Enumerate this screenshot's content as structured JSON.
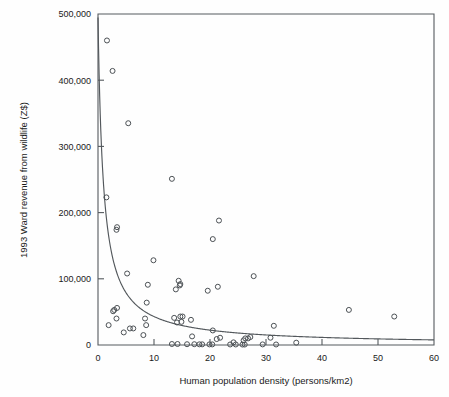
{
  "chart_data": {
    "type": "scatter",
    "title": "",
    "xlabel": "Human population density (persons/km2)",
    "ylabel": "1993 Ward revenue from wildlife (Z$)",
    "xlim": [
      0,
      60
    ],
    "ylim": [
      0,
      500000
    ],
    "xticks": [
      0,
      10,
      20,
      30,
      40,
      50,
      60
    ],
    "yticks": [
      0,
      100000,
      200000,
      300000,
      400000,
      500000
    ],
    "xtick_labels": [
      "0",
      "10",
      "20",
      "30",
      "40",
      "50",
      "60"
    ],
    "ytick_labels": [
      "0",
      "100,000",
      "200,000",
      "300,000",
      "400,000",
      "500,000"
    ],
    "grid": false,
    "legend": null,
    "marker": "open-circle",
    "marker_color": "#4c5155",
    "points": [
      {
        "x": 1.6,
        "y": 460000
      },
      {
        "x": 2.6,
        "y": 414000
      },
      {
        "x": 5.4,
        "y": 335000
      },
      {
        "x": 13.2,
        "y": 251000
      },
      {
        "x": 1.5,
        "y": 223000
      },
      {
        "x": 21.6,
        "y": 188000
      },
      {
        "x": 3.4,
        "y": 178000
      },
      {
        "x": 3.3,
        "y": 174000
      },
      {
        "x": 20.5,
        "y": 160000
      },
      {
        "x": 9.9,
        "y": 128000
      },
      {
        "x": 5.2,
        "y": 108000
      },
      {
        "x": 27.8,
        "y": 104000
      },
      {
        "x": 14.4,
        "y": 97000
      },
      {
        "x": 14.7,
        "y": 92000
      },
      {
        "x": 8.9,
        "y": 91000
      },
      {
        "x": 14.6,
        "y": 90000
      },
      {
        "x": 21.4,
        "y": 88000
      },
      {
        "x": 13.9,
        "y": 84000
      },
      {
        "x": 19.6,
        "y": 82000
      },
      {
        "x": 8.7,
        "y": 64000
      },
      {
        "x": 3.4,
        "y": 56000
      },
      {
        "x": 2.9,
        "y": 53000
      },
      {
        "x": 44.8,
        "y": 53000
      },
      {
        "x": 2.7,
        "y": 51000
      },
      {
        "x": 52.9,
        "y": 43000
      },
      {
        "x": 14.7,
        "y": 43000
      },
      {
        "x": 15.1,
        "y": 43000
      },
      {
        "x": 13.6,
        "y": 41000
      },
      {
        "x": 8.4,
        "y": 40000
      },
      {
        "x": 3.3,
        "y": 40000
      },
      {
        "x": 16.6,
        "y": 38000
      },
      {
        "x": 14.9,
        "y": 35000
      },
      {
        "x": 14.1,
        "y": 34000
      },
      {
        "x": 1.9,
        "y": 30000
      },
      {
        "x": 8.6,
        "y": 30000
      },
      {
        "x": 31.4,
        "y": 29000
      },
      {
        "x": 6.3,
        "y": 25000
      },
      {
        "x": 5.7,
        "y": 25000
      },
      {
        "x": 20.5,
        "y": 22000
      },
      {
        "x": 4.6,
        "y": 19000
      },
      {
        "x": 8.1,
        "y": 15000
      },
      {
        "x": 16.8,
        "y": 13000
      },
      {
        "x": 27.2,
        "y": 12000
      },
      {
        "x": 21.8,
        "y": 11000
      },
      {
        "x": 30.8,
        "y": 11000
      },
      {
        "x": 26.3,
        "y": 10000
      },
      {
        "x": 26.8,
        "y": 10000
      },
      {
        "x": 21.2,
        "y": 9000
      },
      {
        "x": 26.0,
        "y": 7000
      },
      {
        "x": 24.2,
        "y": 4000
      },
      {
        "x": 35.4,
        "y": 3500
      },
      {
        "x": 13.2,
        "y": 1500
      },
      {
        "x": 14.2,
        "y": 1500
      },
      {
        "x": 15.9,
        "y": 1200
      },
      {
        "x": 17.2,
        "y": 1200
      },
      {
        "x": 18.1,
        "y": 1000
      },
      {
        "x": 18.6,
        "y": 1000
      },
      {
        "x": 19.9,
        "y": 900
      },
      {
        "x": 20.4,
        "y": 900
      },
      {
        "x": 23.6,
        "y": 800
      },
      {
        "x": 24.6,
        "y": 800
      },
      {
        "x": 25.8,
        "y": 700
      },
      {
        "x": 26.2,
        "y": 700
      },
      {
        "x": 29.4,
        "y": 900
      },
      {
        "x": 31.8,
        "y": 800
      }
    ],
    "fit_curve": {
      "label": "",
      "form": "hyperbolic decay",
      "a": 470000,
      "b": 0.95,
      "description": "Fitted curve of form y = a / (x + b), descending steeply from upper-left and flattening toward the x-axis"
    },
    "annotations": []
  }
}
